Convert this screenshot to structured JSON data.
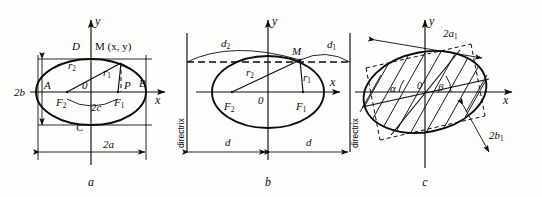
{
  "figure": {
    "background_color": "#fdfdfb",
    "ink_color": "#0d0d0d",
    "captions": [
      "a",
      "b",
      "c"
    ]
  },
  "panel_a": {
    "caption": "a",
    "axis_y": "y",
    "axis_x": "x",
    "origin": "0",
    "point_M": "M (x, y)",
    "vertex_left": "A",
    "vertex_right": "B",
    "vertex_top": "D",
    "vertex_bottom": "C",
    "focus_left": "F",
    "focus_left_sub": "2",
    "focus_right": "F",
    "focus_right_sub": "1",
    "radius_1": "r",
    "radius_1_sub": "1",
    "radius_2": "r",
    "radius_2_sub": "2",
    "foot_P": "P",
    "focal_distance": "2c",
    "major_axis": "2a",
    "minor_axis": "2b"
  },
  "panel_b": {
    "caption": "b",
    "axis_y": "y",
    "axis_x": "x",
    "origin": "0",
    "point_M": "M",
    "focus_left": "F",
    "focus_left_sub": "2",
    "focus_right": "F",
    "focus_right_sub": "1",
    "radius_1": "r",
    "radius_1_sub": "1",
    "radius_2": "r",
    "radius_2_sub": "2",
    "distance_1": "d",
    "distance_1_sub": "1",
    "distance_2": "d",
    "distance_2_sub": "2",
    "directrix_left": "directrix",
    "directrix_right": "directrix",
    "dim_left": "d",
    "dim_right": "d"
  },
  "panel_c": {
    "caption": "c",
    "axis_y": "y",
    "axis_x": "x",
    "origin": "0",
    "angle_alpha": "α",
    "angle_beta": "β",
    "major_axis": "2a",
    "major_axis_sub": "1",
    "minor_axis": "2b",
    "minor_axis_sub": "1"
  }
}
